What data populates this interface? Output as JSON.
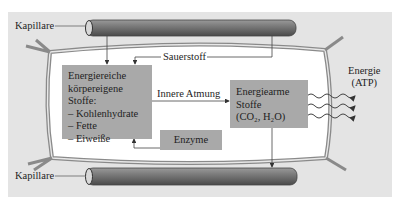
{
  "diagram": {
    "labels": {
      "capillary_top": "Kapillare",
      "capillary_bottom": "Kapillare",
      "oxygen": "Sauerstoff",
      "inner_respiration": "Innere Atmung",
      "energy_line1": "Energie",
      "energy_line2": "(ATP)"
    },
    "high_energy_box": {
      "title_line1": "Energiereiche",
      "title_line2": "körpereigene Stoffe:",
      "items": [
        "– Kohlenhydrate",
        "– Fette",
        "– Eiweiße"
      ]
    },
    "low_energy_box": {
      "line1": "Energiearme",
      "line2": "Stoffe",
      "line3": "(CO₂, H₂O)"
    },
    "enzyme_box": {
      "label": "Enzyme"
    },
    "colors": {
      "background": "#e4e4e4",
      "cell_interior": "#ffffff",
      "box_fill": "#a9a9a9",
      "capillary": "#7a7a7a",
      "lines": "#555555"
    }
  }
}
